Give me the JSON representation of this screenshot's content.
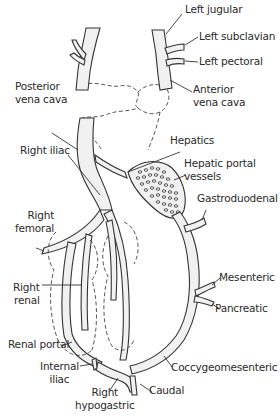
{
  "figure": {
    "labels": {
      "left_jugular": "Left jugular",
      "left_subclavian": "Left subclavian",
      "left_pectoral": "Left pectoral",
      "anterior_vena_cava_1": "Anterior",
      "anterior_vena_cava_2": "vena cava",
      "posterior_vena_cava_1": "Posterior",
      "posterior_vena_cava_2": "vena cava",
      "hepatics": "Hepatics",
      "hepatic_portal_1": "Hepatic portal",
      "hepatic_portal_2": "vessels",
      "right_iliac": "Right iliac",
      "gastroduodenal": "Gastroduodenal",
      "right_femoral_1": "Right",
      "right_femoral_2": "femoral",
      "mesenteric": "Mesenteric",
      "pancreatic": "Pancreatic",
      "right_renal_1": "Right",
      "right_renal_2": "renal",
      "renal_portal": "Renal portal",
      "internal_iliac_1": "Internal",
      "internal_iliac_2": "iliac",
      "coccygeomesenteric": "Coccygeomesenteric",
      "right_hypogastric_1": "Right",
      "right_hypogastric_2": "hypogastric",
      "caudal": "Caudal"
    },
    "colors": {
      "line": "#333333",
      "vessel_fill": "#f1f1f1",
      "text": "#2a2a2a",
      "background": "#ffffff"
    }
  }
}
